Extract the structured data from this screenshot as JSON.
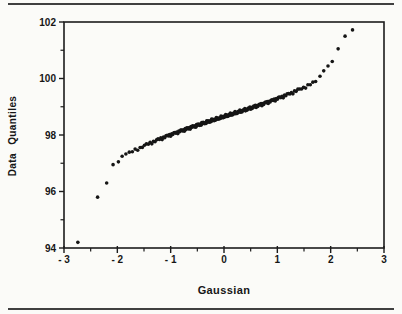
{
  "page": {
    "background": "#fbfbf8",
    "rule_color": "#404040"
  },
  "chart_data": {
    "type": "scatter",
    "subtype": "gaussian-qq-plot",
    "title": "",
    "xlabel": "Gaussian",
    "ylabel": "Data Quantiles",
    "xlim": [
      -3,
      3
    ],
    "ylim": [
      94,
      102
    ],
    "grid": false,
    "legend": "none",
    "axis_color": "#1c1c1c",
    "text_color": "#161616",
    "marker": {
      "shape": "circle",
      "color": "#151515",
      "radius_px": 1.8
    },
    "x_major_ticks": [
      -3,
      -2,
      -1,
      0,
      1,
      2,
      3
    ],
    "x_tick_labels": [
      "- 3",
      "- 2",
      "- 1",
      "0",
      "1",
      "2",
      "3"
    ],
    "x_minor_ticks": [
      -2.5,
      -1.5,
      -0.5,
      0.5,
      1.5,
      2.5
    ],
    "y_major_ticks": [
      94,
      96,
      98,
      100,
      102
    ],
    "y_tick_labels": [
      "94",
      "96",
      "98",
      "100",
      "102"
    ],
    "y_minor_ticks": [
      95,
      97,
      99,
      101
    ],
    "lower_tail_points": [
      [
        -2.74,
        94.2
      ],
      [
        -2.37,
        95.8
      ],
      [
        -2.2,
        96.3
      ],
      [
        -2.08,
        96.95
      ],
      [
        -1.98,
        97.05
      ],
      [
        -1.91,
        97.25
      ],
      [
        -1.84,
        97.33
      ]
    ],
    "upper_tail_points": [
      [
        1.8,
        100.08
      ],
      [
        1.87,
        100.27
      ],
      [
        1.95,
        100.44
      ],
      [
        2.03,
        100.6
      ],
      [
        2.14,
        101.05
      ],
      [
        2.27,
        101.5
      ],
      [
        2.41,
        101.72
      ]
    ],
    "dense_band": {
      "description": "unresolvable overlapping points forming a thick near-linear band",
      "x_start": -1.78,
      "x_end": 1.72,
      "sample_size": 200,
      "quantile_index_range": [
        8,
        192
      ],
      "y_model": "y = 98.65 + 0.60*x + 0.04*x^3",
      "coeffs": {
        "a": 98.65,
        "b": 0.6,
        "c": 0.04
      },
      "jitter": 0.035
    }
  }
}
